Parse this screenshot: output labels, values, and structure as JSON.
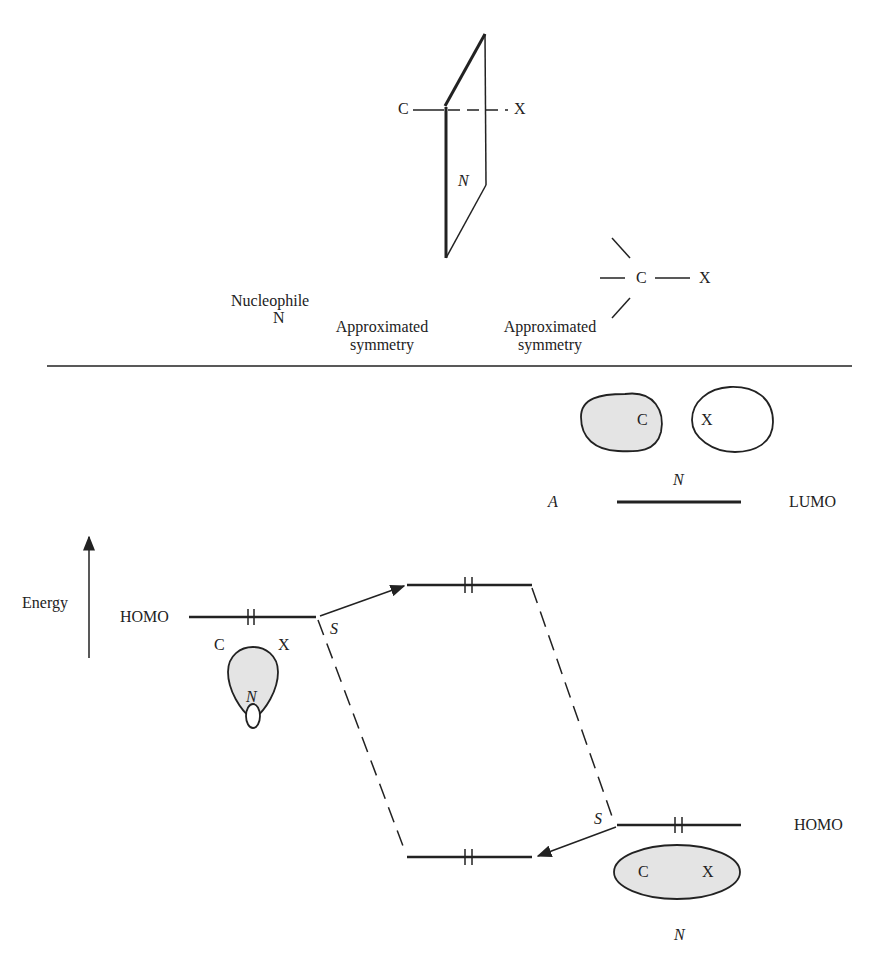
{
  "top_section": {
    "plane_diagram": {
      "atom_left": "C",
      "atom_right": "X",
      "plane_label": "N"
    },
    "nucleophile_label": "Nucleophile",
    "nucleophile_symbol": "N",
    "symmetry_label_1": [
      "Approximated",
      "symmetry"
    ],
    "symmetry_label_2": [
      "Approximated",
      "symmetry"
    ],
    "tetrahedral_center": "C",
    "tetrahedral_leaving": "X"
  },
  "energy_diagram": {
    "axis_label": "Energy",
    "left_level": {
      "label": "HOMO",
      "electrons": "2",
      "orbital_atom_left": "C",
      "orbital_atom_right": "X",
      "orbital_label": "N"
    },
    "lumo_orbital": {
      "atom_c": "C",
      "atom_x": "X",
      "symmetry_label": "N",
      "type_label": "A",
      "level_label": "LUMO"
    },
    "right_homo": {
      "label": "HOMO",
      "electrons": "2",
      "atom_c": "C",
      "atom_x": "X",
      "symmetry_label": "N"
    },
    "interaction_labels": {
      "upper": "S",
      "lower": "S"
    },
    "levels": [
      {
        "name": "upper-combined",
        "electrons": 2
      },
      {
        "name": "lower-combined",
        "electrons": 2
      }
    ]
  },
  "colors": {
    "line": "#222222",
    "orbital_fill": "#e4e4e4",
    "background": "#ffffff"
  }
}
